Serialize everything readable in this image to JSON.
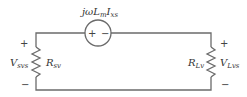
{
  "diagram": {
    "type": "circuit",
    "source": {
      "label_main": "jωL",
      "label_sub1": "m",
      "label_mid": "I",
      "label_sub2": "xs",
      "plus": "+",
      "minus": "−"
    },
    "left_resistor": {
      "name": "R",
      "sub": "sv"
    },
    "left_voltage": {
      "name": "V",
      "sub": "svs",
      "plus": "+",
      "minus": "−"
    },
    "right_resistor": {
      "name": "R",
      "sub": "Lv"
    },
    "right_voltage": {
      "name": "V",
      "sub": "Lvs",
      "plus": "+",
      "minus": "−"
    }
  }
}
